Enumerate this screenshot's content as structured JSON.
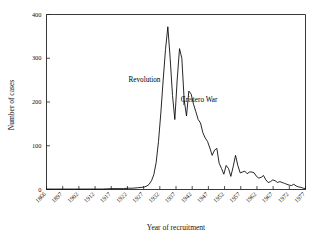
{
  "chart_data": {
    "type": "line",
    "title": "",
    "xlabel": "Year of recruitment",
    "ylabel": "Number of cases",
    "xlim": [
      1866,
      1977
    ],
    "ylim": [
      0,
      400
    ],
    "grid": false,
    "legend": null,
    "y_ticks": [
      0,
      100,
      200,
      300,
      400
    ],
    "y_tick_labels": [
      "0",
      "100",
      "200",
      "300",
      "400"
    ],
    "x_ticks": [
      1866,
      1897,
      1902,
      1912,
      1917,
      1922,
      1927,
      1932,
      1937,
      1942,
      1947,
      1952,
      1957,
      1962,
      1967,
      1972,
      1977
    ],
    "x_tick_labels": [
      "1866",
      "1897",
      "1902",
      "1912",
      "1917",
      "1922",
      "1927",
      "1932",
      "1937",
      "1942",
      "1947",
      "1952",
      "1957",
      "1962",
      "1967",
      "1972",
      "1977"
    ],
    "annotations": [
      {
        "text": "Revolution",
        "x": 1914,
        "y": 245
      },
      {
        "text": "Cristero War",
        "x": 1927,
        "y": 200
      }
    ],
    "x": [
      1866,
      1870,
      1874,
      1878,
      1882,
      1886,
      1890,
      1894,
      1897,
      1899,
      1901,
      1903,
      1905,
      1907,
      1908,
      1909,
      1910,
      1911,
      1912,
      1913,
      1914,
      1915,
      1916,
      1917,
      1918,
      1919,
      1920,
      1921,
      1922,
      1923,
      1924,
      1925,
      1926,
      1927,
      1928,
      1929,
      1930,
      1931,
      1932,
      1933,
      1934,
      1935,
      1936,
      1937,
      1938,
      1939,
      1940,
      1941,
      1942,
      1943,
      1944,
      1945,
      1946,
      1947,
      1948,
      1949,
      1950,
      1951,
      1952,
      1953,
      1954,
      1955,
      1956,
      1957,
      1958,
      1959,
      1960,
      1961,
      1962,
      1963,
      1964,
      1965,
      1966,
      1967,
      1968,
      1969,
      1970,
      1971,
      1972,
      1973,
      1974,
      1975,
      1976,
      1977
    ],
    "values": [
      1,
      1,
      1,
      1,
      1,
      1,
      1,
      2,
      2,
      2,
      3,
      3,
      4,
      5,
      6,
      8,
      12,
      20,
      34,
      62,
      110,
      175,
      250,
      320,
      372,
      300,
      215,
      160,
      250,
      322,
      300,
      205,
      168,
      225,
      218,
      195,
      178,
      160,
      152,
      130,
      118,
      110,
      95,
      78,
      90,
      94,
      60,
      48,
      35,
      55,
      48,
      30,
      52,
      78,
      55,
      38,
      40,
      42,
      36,
      40,
      40,
      38,
      30,
      26,
      28,
      32,
      22,
      16,
      18,
      22,
      20,
      16,
      18,
      16,
      14,
      12,
      10,
      9,
      12,
      8,
      6,
      5,
      3,
      2
    ]
  },
  "figure": {
    "annotation_revolution": "Revolution",
    "annotation_cristero": "Cristero War"
  }
}
